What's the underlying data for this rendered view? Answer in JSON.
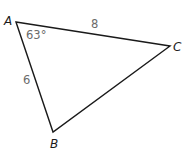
{
  "diagram": {
    "type": "triangle",
    "vertices": [
      {
        "name": "A",
        "x": 16,
        "y": 22,
        "label_x": 4,
        "label_y": 25
      },
      {
        "name": "B",
        "x": 53,
        "y": 132,
        "label_x": 50,
        "label_y": 148
      },
      {
        "name": "C",
        "x": 170,
        "y": 46,
        "label_x": 173,
        "label_y": 51
      }
    ],
    "sides": [
      {
        "between": "AC",
        "label": "8",
        "label_x": 91,
        "label_y": 28
      },
      {
        "between": "AB",
        "label": "6",
        "label_x": 23,
        "label_y": 84
      }
    ],
    "angles": [
      {
        "at": "A",
        "label": "63°",
        "label_x": 26,
        "label_y": 39
      }
    ],
    "colors": {
      "line": "#1a1a1a",
      "vertex_label": "#1a1a1a",
      "measure_label": "#6b6b6b",
      "background": "#ffffff"
    }
  }
}
